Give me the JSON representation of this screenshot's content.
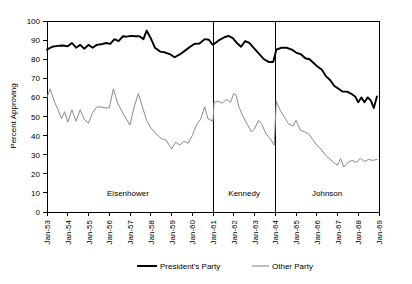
{
  "chart_data": {
    "type": "line",
    "title": "",
    "xlabel": "",
    "ylabel": "Percent Approving",
    "ylim": [
      0,
      100
    ],
    "ytick_values": [
      0,
      10,
      20,
      30,
      40,
      50,
      60,
      70,
      80,
      90,
      100
    ],
    "ytick_labels": [
      "0",
      "10",
      "20",
      "30",
      "40",
      "50",
      "60",
      "70",
      "80",
      "90",
      "100"
    ],
    "xtick_labels": [
      "Jan-53",
      "Jan-54",
      "Jan-55",
      "Jan-56",
      "Jan-57",
      "Jan-58",
      "Jan-59",
      "Jan-60",
      "Jan-61",
      "Jan-62",
      "Jan-63",
      "Jan-64",
      "Jan-65",
      "Jan-66",
      "Jan-67",
      "Jan-68",
      "Jan-69"
    ],
    "xlim": [
      1953.0,
      1969.0
    ],
    "grid": false,
    "legend_position": "bottom-center",
    "legend": [
      "President's Party",
      "Other Party"
    ],
    "colors": {
      "presidents_party": "#000000",
      "other_party": "#8a8a8a",
      "axis": "#000000"
    },
    "era_dividers": [
      1961.0,
      1964.0
    ],
    "era_labels": [
      {
        "label": "Eisenhower",
        "x": 1956.9
      },
      {
        "label": "Kennedy",
        "x": 1962.5
      },
      {
        "label": "Johnson",
        "x": 1966.5
      }
    ],
    "series": [
      {
        "name": "President's Party",
        "style": "thick-black",
        "points": [
          [
            1953.0,
            85.0
          ],
          [
            1953.25,
            86.5
          ],
          [
            1953.5,
            87.0
          ],
          [
            1953.75,
            87.2
          ],
          [
            1954.0,
            86.8
          ],
          [
            1954.2,
            88.5
          ],
          [
            1954.4,
            86.0
          ],
          [
            1954.6,
            87.5
          ],
          [
            1954.8,
            85.5
          ],
          [
            1955.0,
            87.5
          ],
          [
            1955.2,
            86.0
          ],
          [
            1955.4,
            87.5
          ],
          [
            1955.6,
            87.8
          ],
          [
            1955.85,
            88.5
          ],
          [
            1956.05,
            88.0
          ],
          [
            1956.25,
            90.5
          ],
          [
            1956.45,
            89.5
          ],
          [
            1956.65,
            92.0
          ],
          [
            1956.85,
            91.8
          ],
          [
            1957.05,
            92.2
          ],
          [
            1957.25,
            92.0
          ],
          [
            1957.45,
            92.0
          ],
          [
            1957.65,
            90.5
          ],
          [
            1957.8,
            95.0
          ],
          [
            1958.0,
            91.0
          ],
          [
            1958.2,
            86.0
          ],
          [
            1958.45,
            84.0
          ],
          [
            1958.7,
            83.5
          ],
          [
            1958.95,
            82.5
          ],
          [
            1959.15,
            81.0
          ],
          [
            1959.4,
            82.5
          ],
          [
            1959.65,
            84.5
          ],
          [
            1959.9,
            86.5
          ],
          [
            1960.1,
            88.0
          ],
          [
            1960.35,
            88.2
          ],
          [
            1960.6,
            90.5
          ],
          [
            1960.8,
            90.2
          ],
          [
            1960.95,
            88.0
          ],
          [
            1961.0,
            87.5
          ],
          [
            1961.05,
            88.0
          ],
          [
            1961.3,
            90.0
          ],
          [
            1961.55,
            91.5
          ],
          [
            1961.75,
            92.2
          ],
          [
            1961.95,
            91.0
          ],
          [
            1962.15,
            88.5
          ],
          [
            1962.35,
            86.5
          ],
          [
            1962.55,
            89.5
          ],
          [
            1962.75,
            88.5
          ],
          [
            1962.95,
            86.0
          ],
          [
            1963.2,
            83.0
          ],
          [
            1963.45,
            80.0
          ],
          [
            1963.7,
            78.5
          ],
          [
            1963.9,
            78.5
          ],
          [
            1964.05,
            85.0
          ],
          [
            1964.3,
            86.0
          ],
          [
            1964.55,
            86.0
          ],
          [
            1964.8,
            85.0
          ],
          [
            1965.0,
            83.5
          ],
          [
            1965.25,
            82.5
          ],
          [
            1965.45,
            80.5
          ],
          [
            1965.65,
            80.0
          ],
          [
            1965.85,
            78.0
          ],
          [
            1966.05,
            76.0
          ],
          [
            1966.25,
            74.5
          ],
          [
            1966.45,
            71.0
          ],
          [
            1966.65,
            69.0
          ],
          [
            1966.85,
            66.0
          ],
          [
            1967.05,
            64.5
          ],
          [
            1967.25,
            63.0
          ],
          [
            1967.45,
            63.0
          ],
          [
            1967.65,
            62.0
          ],
          [
            1967.85,
            60.5
          ],
          [
            1968.0,
            57.5
          ],
          [
            1968.15,
            60.0
          ],
          [
            1968.3,
            57.5
          ],
          [
            1968.45,
            60.0
          ],
          [
            1968.6,
            58.5
          ],
          [
            1968.75,
            54.5
          ],
          [
            1968.9,
            60.5
          ]
        ]
      },
      {
        "name": "Other Party",
        "style": "thin-gray",
        "points": [
          [
            1953.0,
            60.0
          ],
          [
            1953.15,
            64.5
          ],
          [
            1953.35,
            58.0
          ],
          [
            1953.55,
            53.0
          ],
          [
            1953.7,
            49.0
          ],
          [
            1953.85,
            52.5
          ],
          [
            1954.0,
            47.0
          ],
          [
            1954.2,
            53.5
          ],
          [
            1954.4,
            47.5
          ],
          [
            1954.6,
            53.5
          ],
          [
            1954.8,
            48.5
          ],
          [
            1955.0,
            46.5
          ],
          [
            1955.2,
            52.0
          ],
          [
            1955.4,
            55.0
          ],
          [
            1955.6,
            55.0
          ],
          [
            1955.8,
            54.5
          ],
          [
            1956.0,
            54.5
          ],
          [
            1956.2,
            64.5
          ],
          [
            1956.4,
            57.0
          ],
          [
            1956.6,
            53.0
          ],
          [
            1956.8,
            49.0
          ],
          [
            1957.0,
            45.5
          ],
          [
            1957.2,
            55.0
          ],
          [
            1957.4,
            62.0
          ],
          [
            1957.6,
            55.0
          ],
          [
            1957.8,
            48.0
          ],
          [
            1958.0,
            44.0
          ],
          [
            1958.25,
            41.0
          ],
          [
            1958.5,
            38.5
          ],
          [
            1958.75,
            37.5
          ],
          [
            1959.0,
            33.0
          ],
          [
            1959.2,
            36.5
          ],
          [
            1959.4,
            35.0
          ],
          [
            1959.6,
            37.0
          ],
          [
            1959.8,
            36.0
          ],
          [
            1960.0,
            40.0
          ],
          [
            1960.2,
            45.5
          ],
          [
            1960.4,
            48.5
          ],
          [
            1960.6,
            55.0
          ],
          [
            1960.75,
            49.0
          ],
          [
            1960.9,
            48.0
          ],
          [
            1961.0,
            47.5
          ],
          [
            1961.05,
            57.5
          ],
          [
            1961.25,
            58.0
          ],
          [
            1961.45,
            57.0
          ],
          [
            1961.65,
            59.0
          ],
          [
            1961.85,
            57.5
          ],
          [
            1962.0,
            62.0
          ],
          [
            1962.1,
            61.5
          ],
          [
            1962.25,
            55.0
          ],
          [
            1962.45,
            50.0
          ],
          [
            1962.65,
            46.0
          ],
          [
            1962.85,
            42.0
          ],
          [
            1963.0,
            43.5
          ],
          [
            1963.2,
            48.0
          ],
          [
            1963.35,
            46.0
          ],
          [
            1963.55,
            41.0
          ],
          [
            1963.75,
            38.5
          ],
          [
            1963.95,
            35.0
          ],
          [
            1964.05,
            58.0
          ],
          [
            1964.25,
            53.0
          ],
          [
            1964.45,
            49.5
          ],
          [
            1964.65,
            46.0
          ],
          [
            1964.85,
            45.0
          ],
          [
            1965.0,
            48.0
          ],
          [
            1965.2,
            43.0
          ],
          [
            1965.4,
            42.0
          ],
          [
            1965.6,
            41.0
          ],
          [
            1965.8,
            38.0
          ],
          [
            1966.0,
            35.0
          ],
          [
            1966.2,
            33.0
          ],
          [
            1966.4,
            30.0
          ],
          [
            1966.6,
            28.0
          ],
          [
            1966.8,
            26.0
          ],
          [
            1967.0,
            24.5
          ],
          [
            1967.15,
            28.0
          ],
          [
            1967.3,
            23.5
          ],
          [
            1967.5,
            26.0
          ],
          [
            1967.7,
            27.0
          ],
          [
            1967.9,
            26.0
          ],
          [
            1968.1,
            28.0
          ],
          [
            1968.3,
            26.5
          ],
          [
            1968.5,
            27.5
          ],
          [
            1968.7,
            27.0
          ],
          [
            1968.9,
            27.5
          ]
        ]
      }
    ]
  },
  "legend": {
    "presidents_party": "President's Party",
    "other_party": "Other Party"
  },
  "axes": {
    "ylabel": "Percent Approving"
  }
}
